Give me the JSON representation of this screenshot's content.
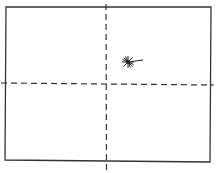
{
  "diagram": {
    "type": "frame-with-crosshair",
    "background": "#ffffff",
    "stroke_color": "#333333",
    "frame": {
      "x1": 6,
      "y1": 7,
      "x2": 211,
      "y2": 7,
      "x3": 210,
      "y3": 162,
      "x4": 5,
      "y4": 160
    },
    "vertical_axis": {
      "x": 106,
      "y_start": 4,
      "y_end": 170,
      "style": "dashed"
    },
    "horizontal_axis": {
      "y": 84,
      "x_start": 1,
      "x_end": 214,
      "style": "dashed"
    },
    "marker": {
      "shape": "starburst",
      "cx": 128,
      "cy": 62,
      "rays": 8,
      "ray_length": 6,
      "tail_x": 143,
      "tail_y": 60
    }
  }
}
